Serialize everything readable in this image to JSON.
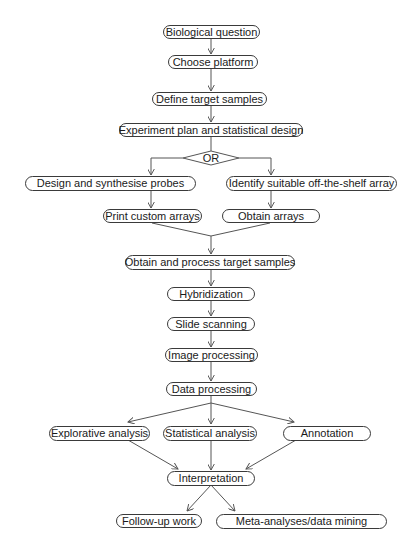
{
  "diagram": {
    "type": "flowchart",
    "nodes": [
      {
        "id": "n1",
        "label": "Biological question"
      },
      {
        "id": "n2",
        "label": "Choose platform"
      },
      {
        "id": "n3",
        "label": "Define target samples"
      },
      {
        "id": "n4",
        "label": "Experiment plan and statistical design"
      },
      {
        "id": "or",
        "label": "OR"
      },
      {
        "id": "n5",
        "label": "Design and synthesise probes"
      },
      {
        "id": "n6",
        "label": "Identify suitable off-the-shelf array"
      },
      {
        "id": "n7",
        "label": "Print custom arrays"
      },
      {
        "id": "n8",
        "label": "Obtain arrays"
      },
      {
        "id": "n9",
        "label": "Obtain and process target samples"
      },
      {
        "id": "n10",
        "label": "Hybridization"
      },
      {
        "id": "n11",
        "label": "Slide scanning"
      },
      {
        "id": "n12",
        "label": "Image processing"
      },
      {
        "id": "n13",
        "label": "Data processing"
      },
      {
        "id": "n14",
        "label": "Explorative analysis"
      },
      {
        "id": "n15",
        "label": "Statistical analysis"
      },
      {
        "id": "n16",
        "label": "Annotation"
      },
      {
        "id": "n17",
        "label": "Interpretation"
      },
      {
        "id": "n18",
        "label": "Follow-up work"
      },
      {
        "id": "n19",
        "label": "Meta-analyses/data mining"
      }
    ],
    "edges": [
      [
        "n1",
        "n2"
      ],
      [
        "n2",
        "n3"
      ],
      [
        "n3",
        "n4"
      ],
      [
        "n4",
        "or"
      ],
      [
        "or",
        "n5"
      ],
      [
        "or",
        "n6"
      ],
      [
        "n5",
        "n7"
      ],
      [
        "n6",
        "n8"
      ],
      [
        "n7",
        "n9"
      ],
      [
        "n8",
        "n9"
      ],
      [
        "n9",
        "n10"
      ],
      [
        "n10",
        "n11"
      ],
      [
        "n11",
        "n12"
      ],
      [
        "n12",
        "n13"
      ],
      [
        "n13",
        "n14"
      ],
      [
        "n13",
        "n15"
      ],
      [
        "n13",
        "n16"
      ],
      [
        "n14",
        "n17"
      ],
      [
        "n15",
        "n17"
      ],
      [
        "n16",
        "n17"
      ],
      [
        "n17",
        "n18"
      ],
      [
        "n17",
        "n19"
      ]
    ],
    "colors": {
      "line": "#555555",
      "border": "#3a3a3a",
      "text": "#1a1a1a",
      "background": "#ffffff"
    }
  }
}
